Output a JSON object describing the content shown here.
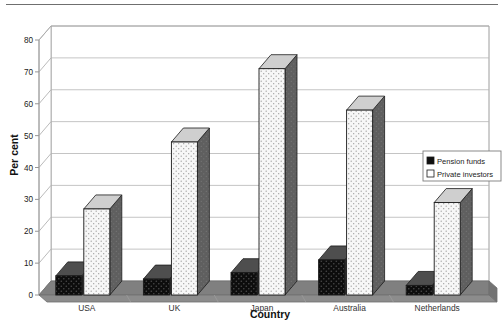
{
  "chart_data": {
    "type": "bar",
    "title": "",
    "subtitle": "",
    "xlabel": "Country",
    "ylabel": "Per cent",
    "categories": [
      "USA",
      "UK",
      "Japan",
      "Australia",
      "Netherlands"
    ],
    "series": [
      {
        "name": "Pension funds",
        "values": [
          6,
          5,
          7,
          11,
          3
        ],
        "swatch": "#101010"
      },
      {
        "name": "Private investors",
        "values": [
          27,
          48,
          71,
          58,
          29
        ],
        "swatch": "#ffffff"
      }
    ],
    "ylim": [
      0,
      80
    ],
    "yticks": [
      0,
      10,
      20,
      30,
      40,
      50,
      60,
      70,
      80
    ],
    "ytick_labels": [
      "0",
      "10",
      "20",
      "30",
      "40",
      "50",
      "60",
      "70",
      "80"
    ],
    "grid": true,
    "grid_axis": "y",
    "legend_position": "right",
    "style": "3d-extruded-bars",
    "colors": {
      "plot_background": "#ffffff",
      "floor": "#808080",
      "gridline": "#b5b5b5",
      "axis": "#8a8a8a",
      "bar_side": "#5d5d5d",
      "bar_top_dark": "#6a6a6a",
      "bar_top_light": "#c9c9c9",
      "pension_face": "#0d0d0d",
      "private_face": "#f2f2f2",
      "text": "#1a1a1a"
    }
  },
  "legend": {
    "items": [
      {
        "label": "Pension funds"
      },
      {
        "label": "Private investors"
      }
    ]
  },
  "axes": {
    "y_title": "Per cent",
    "x_title": "Country"
  }
}
